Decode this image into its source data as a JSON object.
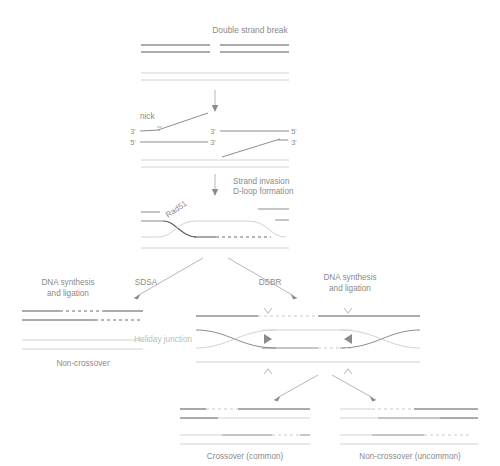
{
  "diagram": {
    "title": "Double strand break",
    "colors": {
      "strand_dark": "#58585a",
      "strand_mid": "#8d8d8f",
      "strand_light": "#d2d2d4",
      "text": "#8a8a8a",
      "text_faint": "#bdbdbd",
      "background": "#ffffff"
    }
  },
  "labels": {
    "title": "Double strand break",
    "nick": "nick",
    "strand_invasion_line1": "Strand invasion",
    "strand_invasion_line2": "D-loop formation",
    "rad51": "Rad51",
    "sdsa": "SDSA",
    "dsbr": "DSBR",
    "dna_synth_left_line1": "DNA synthesis",
    "dna_synth_left_line2": "and ligation",
    "dna_synth_right_line1": "DNA synthesis",
    "dna_synth_right_line2": "and ligation",
    "holiday_junction": "Holiday junction",
    "non_crossover": "Non-crossover",
    "crossover_common": "Crossover (common)",
    "non_crossover_uncommon": "Non-crossover (uncommon)"
  },
  "primes": {
    "left_top": "3'",
    "left_bottom": "5'",
    "mid_top": "3'",
    "mid_bottom": "3'",
    "right_top": "5'",
    "right_bottom": "3'"
  },
  "steps": [
    {
      "id": "step-1-dsb",
      "name": "Double strand break",
      "description": "Broken dark duplex above an intact light homolog duplex"
    },
    {
      "id": "step-2-nick",
      "name": "nick",
      "description": "5' to 3' resection generating 3' single strand overhangs"
    },
    {
      "id": "step-3-invasion",
      "name": "Strand invasion / D-loop formation",
      "description": "Rad51 filament drives invasion of homolog forming a D-loop"
    },
    {
      "id": "step-4a-sdsa",
      "name": "SDSA",
      "description": "Synthesis dependent strand annealing yielding non-crossover"
    },
    {
      "id": "step-4b-dsbr",
      "name": "DSBR",
      "description": "Double strand break repair through double Holiday junction"
    }
  ],
  "outcomes": [
    {
      "id": "outcome-sdsa",
      "label": "Non-crossover"
    },
    {
      "id": "outcome-crossover",
      "label": "Crossover (common)"
    },
    {
      "id": "outcome-noncrossover",
      "label": "Non-crossover (uncommon)"
    }
  ]
}
